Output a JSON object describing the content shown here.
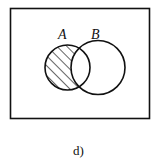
{
  "diagram": {
    "type": "venn",
    "sets": [
      {
        "label": "A"
      },
      {
        "label": "B"
      }
    ],
    "shaded_region": "A \\ B",
    "caption": "d)"
  }
}
